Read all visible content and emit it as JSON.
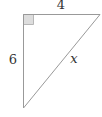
{
  "diagram": {
    "type": "right-triangle",
    "vertices": {
      "right_angle": [
        23,
        14
      ],
      "top_right": [
        100,
        14
      ],
      "bottom": [
        23,
        108
      ]
    },
    "sides": {
      "top": {
        "label": "4",
        "length": 4
      },
      "left": {
        "label": "6",
        "length": 6
      },
      "hypotenuse": {
        "label": "x",
        "length": "unknown"
      }
    },
    "right_angle_marker": {
      "size": 10,
      "fill": "#dddddd"
    },
    "colors": {
      "stroke": "#999999",
      "label": "#333333",
      "background": "#ffffff"
    }
  }
}
